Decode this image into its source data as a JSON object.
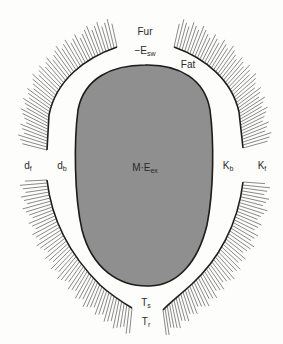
{
  "colors": {
    "background": "#fdfdfb",
    "core_fill": "#8f8f8f",
    "outline": "#1c1c1c",
    "hair": "#3a3a3a"
  },
  "labels": {
    "fur": {
      "text": "Fur"
    },
    "sweat": {
      "prefix": "−E",
      "sub": "sw"
    },
    "fat": {
      "text": "Fat"
    },
    "d_f": {
      "base": "d",
      "sub": "f"
    },
    "d_b": {
      "base": "d",
      "sub": "b"
    },
    "core": {
      "base": "M·E",
      "sub": "ex"
    },
    "k_b": {
      "base": "K",
      "sub": "b"
    },
    "k_f": {
      "base": "K",
      "sub": "f"
    },
    "t_s": {
      "base": "T",
      "sub": "s"
    },
    "t_r": {
      "base": "T",
      "sub": "r"
    }
  }
}
